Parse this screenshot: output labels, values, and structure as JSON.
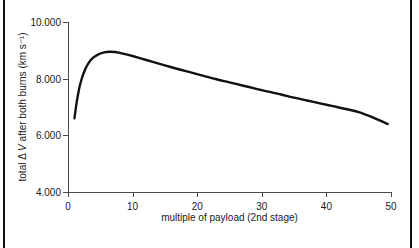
{
  "figure": {
    "background_color": "#ffffff",
    "frame_color": "#111111",
    "axis_color": "#4a4a4a",
    "curve_color": "#111111"
  },
  "chart_data": {
    "type": "line",
    "title": "",
    "xlabel": "multiple of payload (2nd stage)",
    "ylabel": "total Δ V after both burns (km s⁻¹)",
    "ylabel_parts": {
      "prefix": "total Δ ",
      "italic": "V",
      "suffix": " after both burns (km s⁻¹)"
    },
    "xlim": [
      0,
      50
    ],
    "ylim": [
      4.0,
      10.0
    ],
    "grid": false,
    "legend": null,
    "xticks": [
      0,
      10,
      20,
      30,
      40,
      50
    ],
    "xtick_labels": [
      "0",
      "10",
      "20",
      "30",
      "40",
      "50"
    ],
    "yticks": [
      4.0,
      6.0,
      8.0,
      10.0
    ],
    "ytick_labels": [
      "4.000",
      "6.000",
      "8.000",
      "10.000"
    ],
    "series": [
      {
        "name": "total delta-V",
        "x": [
          1.0,
          1.3,
          1.7,
          2.1,
          2.6,
          3.2,
          3.9,
          4.7,
          5.6,
          6.5,
          7.2,
          8.0,
          9.0,
          10.0,
          11.5,
          13.0,
          15.0,
          17.0,
          19.0,
          21.0,
          23.0,
          25.0,
          27.0,
          29.0,
          31.0,
          33.0,
          35.0,
          37.0,
          39.0,
          41.0,
          43.0,
          45.0,
          47.0,
          49.5
        ],
        "y": [
          6.6,
          7.1,
          7.62,
          7.98,
          8.3,
          8.56,
          8.74,
          8.86,
          8.93,
          8.95,
          8.94,
          8.91,
          8.86,
          8.8,
          8.7,
          8.6,
          8.47,
          8.34,
          8.22,
          8.1,
          7.98,
          7.87,
          7.76,
          7.65,
          7.54,
          7.44,
          7.33,
          7.23,
          7.13,
          7.03,
          6.93,
          6.82,
          6.65,
          6.4
        ]
      }
    ],
    "peak": {
      "x": 6.5,
      "y": 8.95
    },
    "start_point": {
      "x": 1.0,
      "y": 6.6
    },
    "end_point": {
      "x": 49.5,
      "y": 6.4
    }
  }
}
